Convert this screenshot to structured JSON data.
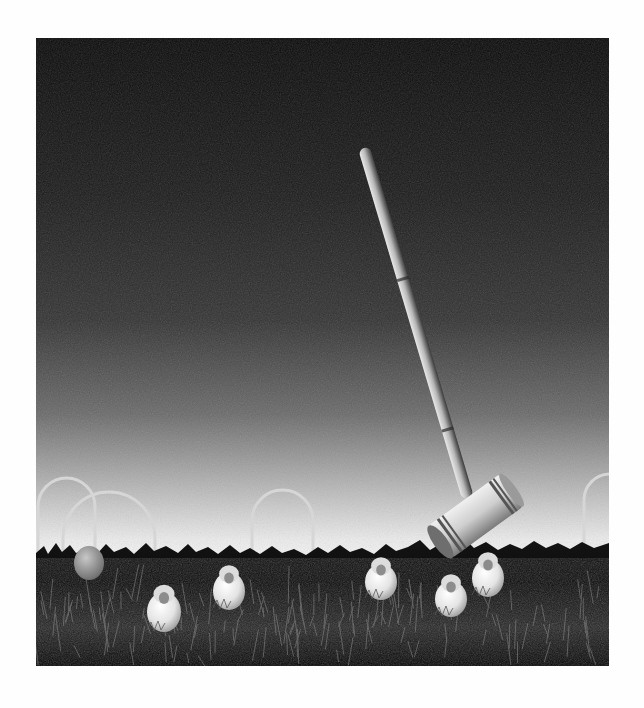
{
  "page": {
    "background": "#fefefe",
    "width": 644,
    "height": 708
  },
  "photo": {
    "alt": "Black-and-white photograph: a croquet mallet tumbling through a dark sky above a grassy lawn with wire hoops and small white fluffy chicks among the balls",
    "style": "monochrome",
    "frame": {
      "x": 36,
      "y": 38,
      "width": 573,
      "height": 628
    },
    "colors": {
      "sky_top": "#0b0b0b",
      "sky_mid": "#3a3a3a",
      "sky_horizon": "#f2f2f2",
      "grass": "#080808",
      "grass_highlight": "#9a9a9a",
      "object_light": "#e6e6e6",
      "object_shadow": "#8a8a8a"
    },
    "horizon_y": 512,
    "mallet": {
      "handle_top": [
        328,
        110
      ],
      "handle_bottom": [
        432,
        460
      ],
      "head_center": [
        440,
        478
      ],
      "head_length": 88,
      "head_radius": 20,
      "head_angle": -36
    },
    "hoops": [
      {
        "name": "hoop-far-left",
        "x1": 2,
        "x2": 59,
        "top": 440,
        "bottom": 520
      },
      {
        "name": "hoop-left",
        "x1": 27,
        "x2": 119,
        "top": 454,
        "bottom": 565
      },
      {
        "name": "hoop-center",
        "x1": 216,
        "x2": 277,
        "top": 452,
        "bottom": 585
      },
      {
        "name": "hoop-right",
        "x1": 548,
        "x2": 600,
        "top": 436,
        "bottom": 520
      }
    ],
    "balls": [
      {
        "name": "gray-ball",
        "cx": 53,
        "cy": 525,
        "rx": 15,
        "ry": 17,
        "fill": "#9c9c9c"
      }
    ],
    "chicks": [
      {
        "name": "chick-1",
        "cx": 128,
        "cy": 574,
        "rx": 17,
        "ry": 20
      },
      {
        "name": "chick-2",
        "cx": 193,
        "cy": 553,
        "rx": 16,
        "ry": 19
      },
      {
        "name": "chick-3",
        "cx": 345,
        "cy": 544,
        "rx": 16,
        "ry": 18
      },
      {
        "name": "chick-4",
        "cx": 415,
        "cy": 561,
        "rx": 16,
        "ry": 18
      },
      {
        "name": "chick-5",
        "cx": 452,
        "cy": 540,
        "rx": 16,
        "ry": 19
      }
    ]
  }
}
